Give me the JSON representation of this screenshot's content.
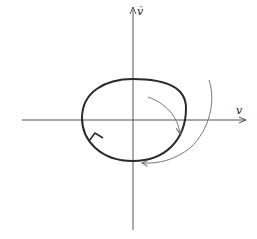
{
  "diagram": {
    "type": "phase-portrait",
    "axes": {
      "x_label": "v",
      "y_label": "v̇",
      "origin": [
        133,
        120
      ],
      "x_range_px": [
        22,
        246
      ],
      "y_range_px": [
        6,
        230
      ]
    },
    "limit_cycle": {
      "shape": "closed-orbit",
      "direction": "counterclockwise-arrow-on-left",
      "stroke_color": "#2a2a2a"
    },
    "trajectories": [
      {
        "name": "inner-trajectory",
        "approaches": "limit-cycle-from-inside"
      },
      {
        "name": "outer-trajectory",
        "approaches": "limit-cycle-from-outside"
      }
    ],
    "colors": {
      "axis": "#555555",
      "cycle": "#2a2a2a",
      "trajectory": "#777777"
    }
  }
}
